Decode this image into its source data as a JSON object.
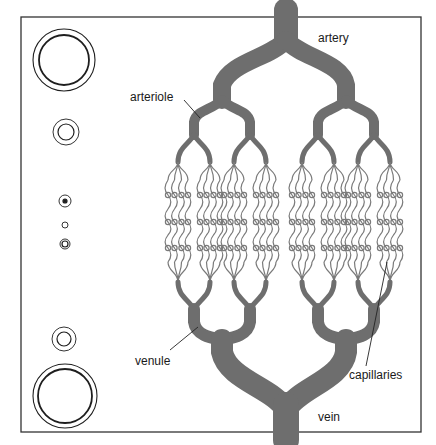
{
  "diagram": {
    "type": "blood vessel branching schematic",
    "colors": {
      "vessel_fill": "#6e6e6e",
      "capillary_stroke": "#7a7a7a",
      "frame": "#333333",
      "cross_section_stroke": "#1e1e1e",
      "background": "#ffffff"
    },
    "labels": {
      "artery": "artery",
      "arteriole": "arteriole",
      "capillaries": "capillaries",
      "venule": "venule",
      "vein": "vein"
    },
    "cross_sections": [
      {
        "name": "artery",
        "cx": 64,
        "cy": 60,
        "r_outer": 31,
        "r_inner": 25
      },
      {
        "name": "arteriole",
        "cx": 66,
        "cy": 132,
        "r_outer": 13,
        "r_inner": 8
      },
      {
        "name": "small-arteriole",
        "cx": 65,
        "cy": 201,
        "r_outer": 6,
        "r_inner": 2
      },
      {
        "name": "capillary",
        "cx": 65,
        "cy": 225,
        "r_outer": 3,
        "r_inner": 0
      },
      {
        "name": "small-venule",
        "cx": 65,
        "cy": 244,
        "r_outer": 5,
        "r_inner": 3
      },
      {
        "name": "venule",
        "cx": 64,
        "cy": 339,
        "r_outer": 12,
        "r_inner": 7
      },
      {
        "name": "vein",
        "cx": 65,
        "cy": 396,
        "r_outer": 32,
        "r_inner": 27
      }
    ]
  }
}
